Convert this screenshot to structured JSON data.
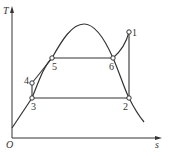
{
  "diagram": {
    "type": "T-s diagram",
    "axes": {
      "y_label": "T",
      "x_label": "s",
      "origin_label": "O"
    },
    "points": [
      {
        "id": "1",
        "label": "1",
        "x": 129,
        "y": 32
      },
      {
        "id": "2",
        "label": "2",
        "x": 129,
        "y": 98
      },
      {
        "id": "3",
        "label": "3",
        "x": 32,
        "y": 98
      },
      {
        "id": "4",
        "label": "4",
        "x": 32,
        "y": 83
      },
      {
        "id": "5",
        "label": "5",
        "x": 52,
        "y": 58
      },
      {
        "id": "6",
        "label": "6",
        "x": 113,
        "y": 58
      }
    ],
    "colors": {
      "stroke": "#333333",
      "background": "#ffffff"
    }
  }
}
